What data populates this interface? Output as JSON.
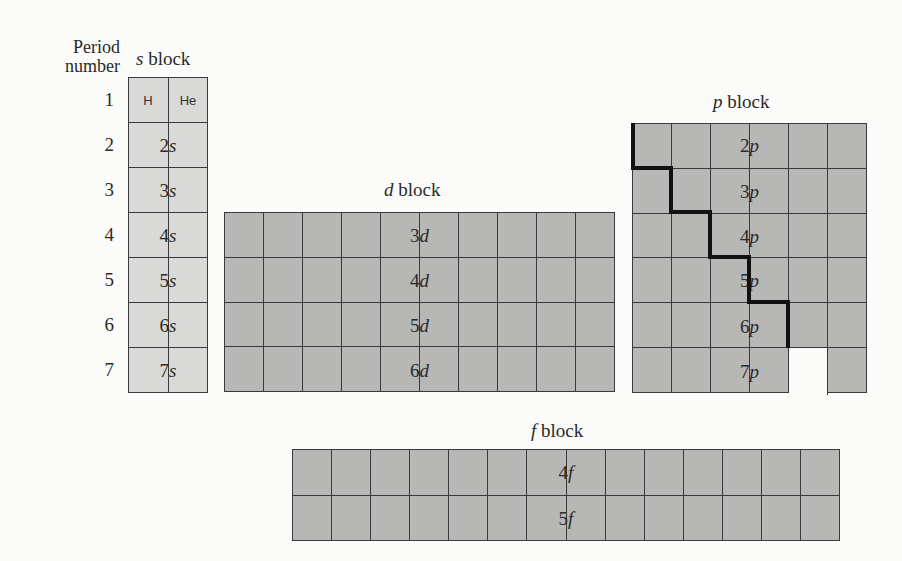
{
  "colors": {
    "s_block": "#d9d9d7",
    "other_blocks": "#b7b7b5",
    "grid_lines": "#3a3a3a",
    "staircase": "#111111",
    "background": "#fbfbf9"
  },
  "period_header": "Period number",
  "period_header_line1": "Period",
  "period_header_line2": "number",
  "periods": [
    "1",
    "2",
    "3",
    "4",
    "5",
    "6",
    "7"
  ],
  "blocks": {
    "s": {
      "title_letter": "s",
      "title_word": " block",
      "columns": 2,
      "rows": 7,
      "row1_elements": [
        "H",
        "He"
      ],
      "row_labels": [
        {
          "n": "2",
          "l": "s"
        },
        {
          "n": "3",
          "l": "s"
        },
        {
          "n": "4",
          "l": "s"
        },
        {
          "n": "5",
          "l": "s"
        },
        {
          "n": "6",
          "l": "s"
        },
        {
          "n": "7",
          "l": "s"
        }
      ]
    },
    "d": {
      "title_letter": "d",
      "title_word": " block",
      "columns": 10,
      "rows": 4,
      "row_labels": [
        {
          "n": "3",
          "l": "d"
        },
        {
          "n": "4",
          "l": "d"
        },
        {
          "n": "5",
          "l": "d"
        },
        {
          "n": "6",
          "l": "d"
        }
      ]
    },
    "p": {
      "title_letter": "p",
      "title_word": " block",
      "columns": 6,
      "rows": 6,
      "row_labels": [
        {
          "n": "2",
          "l": "p"
        },
        {
          "n": "3",
          "l": "p"
        },
        {
          "n": "4",
          "l": "p"
        },
        {
          "n": "5",
          "l": "p"
        },
        {
          "n": "6",
          "l": "p"
        },
        {
          "n": "7",
          "l": "p"
        }
      ],
      "missing_cells": [
        {
          "row": 6,
          "col": 5
        }
      ]
    },
    "f": {
      "title_letter": "f",
      "title_word": " block",
      "columns": 14,
      "rows": 2,
      "row_labels": [
        {
          "n": "4",
          "l": "f"
        },
        {
          "n": "5",
          "l": "f"
        }
      ]
    }
  }
}
